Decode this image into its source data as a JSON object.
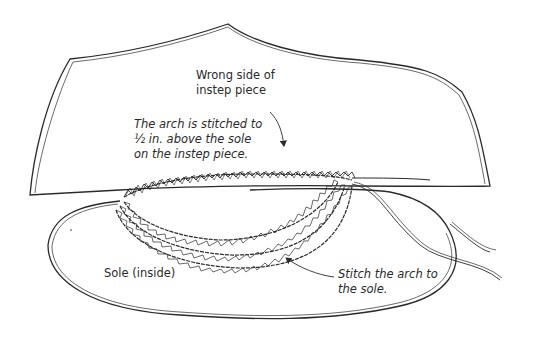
{
  "diagram": {
    "type": "illustration",
    "colors": {
      "ink": "#2a2a2a",
      "background": "#ffffff"
    },
    "parts": {
      "instep_piece": "instep-piece-outline",
      "sole": "sole-outline",
      "stitch_rows": 3,
      "thread_tails": 2
    },
    "labels": {
      "instep": {
        "line1": "Wrong side of",
        "line2": "instep piece"
      },
      "arch_top": {
        "line1": "The arch is stitched to",
        "line2": "½ in. above the sole",
        "line3": "on the instep piece."
      },
      "sole": {
        "line1": "Sole (inside)"
      },
      "stitch": {
        "line1": "Stitch the arch to",
        "line2": "the sole."
      }
    },
    "arrows": [
      {
        "name": "arch-top-arrow",
        "from": "arch_top label",
        "to": "top stitch row"
      },
      {
        "name": "stitch-arrow",
        "from": "stitch label",
        "to": "bottom stitch row"
      }
    ]
  }
}
